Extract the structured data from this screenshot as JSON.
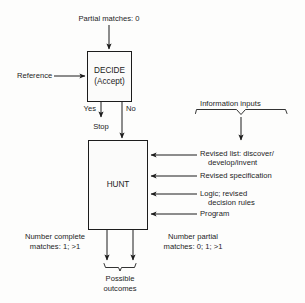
{
  "diagram": {
    "background_color": "#fdfdfc",
    "line_color": "#1c1c1c",
    "box_fill": "#fbfbfa"
  },
  "top_input": {
    "label": "Partial matches: 0"
  },
  "side_input": {
    "label": "Reference"
  },
  "decide_box": {
    "line1": "DECIDE",
    "line2": "(Accept)"
  },
  "branches": {
    "yes_label": "Yes",
    "no_label": "No",
    "stop_label": "Stop"
  },
  "hunt_box": {
    "label": "HUNT"
  },
  "information_inputs": {
    "header": "Information inputs",
    "items": [
      {
        "line1": "Revised list: discover/",
        "line2": "develop/invent"
      },
      {
        "line1": "Revised specification",
        "line2": ""
      },
      {
        "line1": "Logic; revised",
        "line2": "decision rules"
      },
      {
        "line1": "Program",
        "line2": ""
      }
    ]
  },
  "outputs": {
    "left": {
      "line1": "Number complete",
      "line2": "matches: 1; >1"
    },
    "right": {
      "line1": "Number partial",
      "line2": "matches: 0; 1; >1"
    },
    "summary": {
      "line1": "Possible",
      "line2": "outcomes"
    }
  }
}
